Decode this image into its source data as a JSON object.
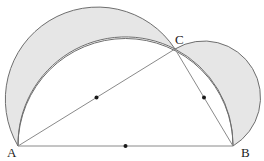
{
  "diagram": {
    "type": "geometry",
    "points": {
      "A": {
        "label": "A",
        "x": 18,
        "y": 146
      },
      "B": {
        "label": "B",
        "x": 233,
        "y": 146
      },
      "C": {
        "label": "C",
        "x": 175,
        "y": 49
      }
    },
    "midpoints": [
      {
        "name": "midpoint-AB",
        "x": 125.5,
        "y": 146
      },
      {
        "name": "midpoint-AC",
        "x": 96.5,
        "y": 97.5
      },
      {
        "name": "midpoint-CB",
        "x": 204,
        "y": 97.5
      }
    ],
    "colors": {
      "stroke": "#6e6e6e",
      "fill": "#e6e6e6",
      "dot": "#1a1a1a",
      "background": "#ffffff"
    }
  }
}
